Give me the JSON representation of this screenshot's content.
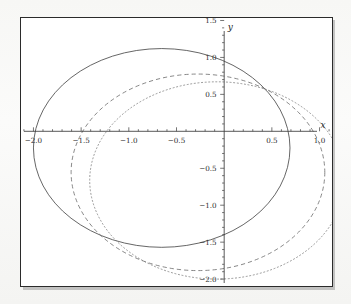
{
  "figure": {
    "background_color": "#ffffff",
    "frame_color": "#2b2b2b",
    "axis_color": "#3a3a3a"
  },
  "chart_data": {
    "type": "line",
    "title": "",
    "xlabel": "x",
    "ylabel": "y",
    "xlim": [
      -2.12,
      1.12
    ],
    "ylim": [
      -2.08,
      1.52
    ],
    "grid": false,
    "legend": "none",
    "axes_style": "centered-cross",
    "xticks": [
      -2.0,
      -1.5,
      -1.0,
      -0.5,
      0.5,
      1.0
    ],
    "xtick_labels": [
      "-2.0",
      "-1.5",
      "-1.0",
      "-0.5",
      "0.5",
      "1.0"
    ],
    "yticks": [
      1.5,
      1.0,
      0.5,
      -0.5,
      -1.0,
      -1.5,
      -2.0
    ],
    "ytick_labels": [
      "1.5",
      "1.0",
      "0.5",
      "-0.5",
      "-1.0",
      "-1.5",
      "-2.0"
    ],
    "minor_tick_step": 0.1,
    "series": [
      {
        "name": "solid-circle",
        "style": "solid",
        "color": "#4a4a4a",
        "shape": "circle",
        "center": [
          -0.655,
          -0.225
        ],
        "radius": 1.345,
        "x_intercepts": [
          -2.0,
          0.67
        ],
        "y_extent": [
          -1.45,
          1.06
        ],
        "x_extent": [
          -2.0,
          0.69
        ]
      },
      {
        "name": "dashed-circle",
        "style": "dashed",
        "color": "#6a6a6a",
        "shape": "circle",
        "center": [
          -0.275,
          -0.555
        ],
        "radius": 1.33,
        "x_intercepts": [
          -1.47,
          0.92
        ],
        "y_extent": [
          -1.885,
          0.78
        ],
        "x_extent": [
          -1.605,
          1.055
        ]
      },
      {
        "name": "dotted-circle",
        "style": "dotted",
        "color": "#7d7d7d",
        "shape": "circle",
        "center": [
          -0.075,
          -0.665
        ],
        "radius": 1.335,
        "x_intercepts": [
          -1.08,
          0.93
        ],
        "y_extent": [
          -2.0,
          0.67
        ],
        "x_extent": [
          -1.41,
          1.26
        ]
      }
    ]
  }
}
